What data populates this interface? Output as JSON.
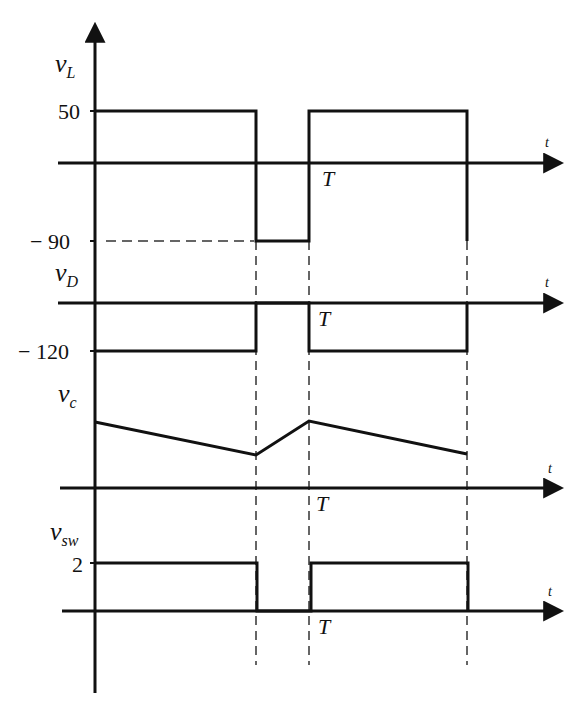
{
  "figure": {
    "type": "timing-waveform-diagram",
    "vertical_axis": {
      "x": 95,
      "top": 22,
      "bottom": 693
    },
    "time_markers": {
      "t_off": 256,
      "T": 309,
      "t_end": 467
    },
    "dashed_lines_bottom": 665,
    "panels": [
      {
        "id": "vL",
        "symbol": "v",
        "subscript": "L",
        "axis_y": 163,
        "axis_label": "t",
        "period_label": "T",
        "levels": [
          {
            "label": "50",
            "y": 111
          },
          {
            "label": "− 90",
            "y": 241,
            "dashed_guide": true
          }
        ],
        "waveform": "95,111 256,111 256,241 309,241 309,111 467,111 467,241"
      },
      {
        "id": "vD",
        "symbol": "v",
        "subscript": "D",
        "axis_y": 303,
        "axis_label": "t",
        "period_label": "T",
        "levels": [
          {
            "label": "− 120",
            "y": 351
          }
        ],
        "waveform": "95,351 256,351 256,303 309,303 309,351 467,351 467,303"
      },
      {
        "id": "vc",
        "symbol": "v",
        "subscript": "c",
        "axis_y": 488,
        "axis_label": "t",
        "period_label": "T",
        "levels": [],
        "waveform": "95,422 256,455 309,421 467,454"
      },
      {
        "id": "vsw",
        "symbol": "v",
        "subscript": "sw",
        "axis_y": 611,
        "axis_label": "t",
        "period_label": "T",
        "levels": [
          {
            "label": "2",
            "y": 563
          }
        ],
        "waveform": "95,563 256,563 256,611 309,611 309,563 467,563 467,611"
      }
    ]
  },
  "labels": {
    "vL_symbol": "v",
    "vL_sub": "L",
    "vD_symbol": "v",
    "vD_sub": "D",
    "vc_symbol": "v",
    "vc_sub": "c",
    "vsw_symbol": "v",
    "vsw_sub": "sw",
    "level_50": "50",
    "level_neg90": "− 90",
    "level_neg120": "− 120",
    "level_2": "2",
    "t": "t",
    "T": "T"
  }
}
